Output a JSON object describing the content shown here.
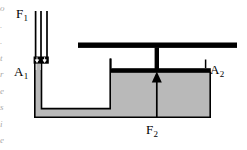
{
  "figure": {
    "type": "physics-diagram",
    "labels": {
      "force_small_base": "F",
      "force_small_sub": "1",
      "area_small_base": "A",
      "area_small_sub": "1",
      "area_large_base": "A",
      "area_large_sub": "2",
      "force_large_base": "F",
      "force_large_sub": "2"
    },
    "colors": {
      "fluid": "#b9b9b9",
      "outline": "#000000",
      "background": "#ffffff",
      "piston": "#000000",
      "margin_text": "#8d8d8d"
    },
    "elements": {
      "small_piston_name": "small-piston",
      "large_piston_name": "large-piston",
      "narrow_tube_name": "narrow-tube",
      "reservoir_name": "fluid-reservoir",
      "lever_bar_name": "lever-bar",
      "arrow_down_name": "force-down-arrow",
      "arrow_up_name": "force-up-arrow"
    }
  },
  "margin_bleed": {
    "text": "o\n.\n.\nt\nr\ne\ns\ni\ne"
  }
}
